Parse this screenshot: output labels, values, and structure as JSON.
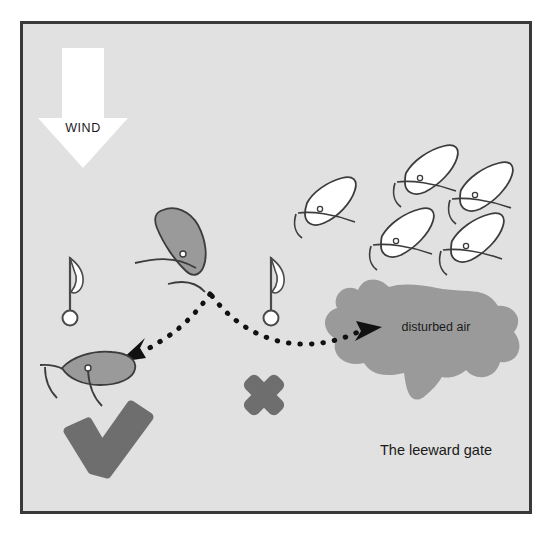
{
  "figure": {
    "title": "The leeward gate",
    "background_color": "#e0e0e0",
    "frame_color": "#3a3a3a",
    "page_color": "#ffffff"
  },
  "wind": {
    "label": "WIND",
    "arrow_color": "#ffffff",
    "direction": "down"
  },
  "annotations": {
    "disturbed_air_label": "disturbed air",
    "gate_label": "The leeward gate",
    "blob_color": "#9a9a9a"
  },
  "symbols": {
    "check_label": "correct-choice-check",
    "check_color": "#6e6e6e",
    "cross_label": "wrong-choice-cross",
    "cross_color": "#6e6e6e"
  },
  "marks": [
    {
      "name": "left-gate-mark",
      "x": 70,
      "y": 255
    },
    {
      "name": "right-gate-mark",
      "x": 271,
      "y": 255
    }
  ],
  "boats": {
    "focus_color": "#9a9a9a",
    "fleet_color": "#ffffff",
    "outline_color": "#3c3c3c",
    "focus": [
      {
        "name": "approaching-boat",
        "x": 176,
        "y": 243
      },
      {
        "name": "chosen-boat",
        "x": 92,
        "y": 368
      }
    ],
    "fleet": [
      {
        "name": "fleet-boat-1",
        "x": 332,
        "y": 196
      },
      {
        "name": "fleet-boat-2",
        "x": 433,
        "y": 163
      },
      {
        "name": "fleet-boat-3",
        "x": 487,
        "y": 180
      },
      {
        "name": "fleet-boat-4",
        "x": 408,
        "y": 228
      },
      {
        "name": "fleet-boat-5",
        "x": 478,
        "y": 233
      }
    ]
  },
  "paths": [
    {
      "name": "path-to-left-gate",
      "style": "dotted",
      "color": "#111111",
      "endpoint": "left"
    },
    {
      "name": "path-to-right-gate",
      "style": "dotted",
      "color": "#111111",
      "endpoint": "right"
    }
  ]
}
